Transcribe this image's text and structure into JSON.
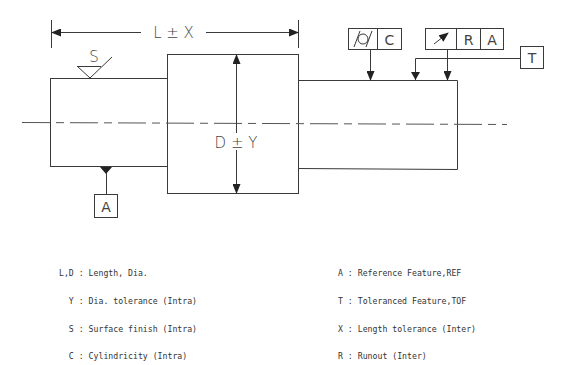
{
  "drawing": {
    "dimension_length": "L ± X",
    "dimension_diameter": "D ± Y",
    "surface_finish_symbol": "S",
    "datum_label": "A",
    "toleranced_feature_label": "T",
    "cylindricity_frame": {
      "symbol": "cylindricity-icon",
      "value": "C"
    },
    "runout_frame": {
      "symbol": "runout-arrow-icon",
      "value": "R",
      "datum": "A"
    }
  },
  "legend_left": [
    {
      "key": "L,D",
      "text": "Length, Dia."
    },
    {
      "key": "Y",
      "text": "Dia. tolerance (Intra)"
    },
    {
      "key": "S",
      "text": "Surface finish (Intra)"
    },
    {
      "key": "C",
      "text": "Cylindricity (Intra)"
    }
  ],
  "legend_right": [
    {
      "key": "A",
      "text": "Reference Feature,REF"
    },
    {
      "key": "T",
      "text": "Toleranced Feature,TOF"
    },
    {
      "key": "X",
      "text": "Length tolerance (Inter)"
    },
    {
      "key": "R",
      "text": "Runout (Inter)"
    }
  ]
}
